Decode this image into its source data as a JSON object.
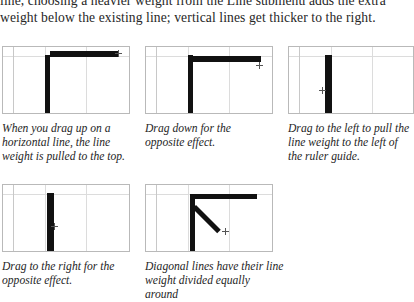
{
  "body_text": {
    "line1": "line, choosing a heavier weight from the Line submenu adds the extra",
    "line2": "weight below the existing line; vertical lines get thicker to the right."
  },
  "figures": [
    {
      "id": "figure-drag-up-horizontal",
      "caption": "When you drag up on a horizontal line, the line weight is pulled to the top.",
      "strokes": "vertical-line-plus-horizontal-bar-at-top"
    },
    {
      "id": "figure-drag-down",
      "caption": "Drag down for the opposite effect.",
      "strokes": "vertical-line-plus-horizontal-bar-below-guide"
    },
    {
      "id": "figure-drag-left",
      "caption": "Drag to the left to pull the line weight to the left of the ruler guide.",
      "strokes": "thick-vertical-bar-left-of-guide"
    },
    {
      "id": "figure-drag-right",
      "caption": "Drag to the right for the opposite effect.",
      "strokes": "thick-vertical-bar-right-of-guide"
    },
    {
      "id": "figure-diagonal-lines",
      "caption": "Diagonal lines have their line weight divided equally around",
      "strokes": "corner-plus-diagonal-line"
    }
  ],
  "colors": {
    "stroke": "#111111",
    "panel_border": "#b9b9b9",
    "guide": "#dcdcdc",
    "ruler": "#c8c8c8",
    "text": "#262626",
    "page_background": "#ffffff"
  }
}
